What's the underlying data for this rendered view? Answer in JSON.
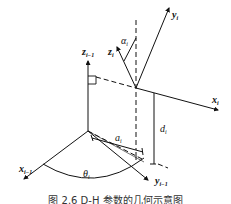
{
  "figure": {
    "caption": "图 2.6  D-H 参数的几何示意图",
    "labels": {
      "y_i": {
        "base": "y",
        "sub": "i"
      },
      "z_i": {
        "base": "z",
        "sub": "i"
      },
      "alpha_i": {
        "base": "α",
        "sub": "i"
      },
      "z_im1": {
        "base": "z",
        "sub": "i−1"
      },
      "x_i": {
        "base": "x",
        "sub": "i"
      },
      "d_i": {
        "base": "d",
        "sub": "i"
      },
      "a_i": {
        "base": "a",
        "sub": "i"
      },
      "x_im1": {
        "base": "x",
        "sub": "i−1"
      },
      "theta_i": {
        "base": "θ",
        "sub": "i"
      },
      "y_im1": {
        "base": "y",
        "sub": "i−1"
      }
    },
    "colors": {
      "line": "#111111",
      "background": "#ffffff"
    }
  }
}
